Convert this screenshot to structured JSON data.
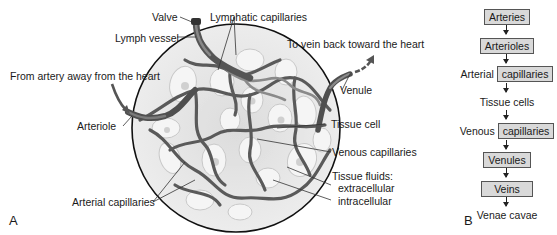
{
  "panel_a": {
    "letter": "A",
    "labels": {
      "valve": "Valve",
      "lymph_vessel": "Lymph vessel",
      "lymphatic_capillaries": "Lymphatic capillaries",
      "to_vein": "To vein back toward the heart",
      "from_artery": "From artery away from the heart",
      "venule": "Venule",
      "arteriole": "Arteriole",
      "tissue_cell": "Tissue cell",
      "venous_capillaries": "Venous capillaries",
      "tissue_fluids": "Tissue fluids:",
      "extracellular": "extracellular",
      "intracellular": "intracellular",
      "arterial_capillaries": "Arterial capillaries"
    },
    "colors": {
      "vessel": "#6e6e6e",
      "vessel_dark": "#4a4a4a",
      "circle_fill": "#e6e6e6",
      "cell_fill": "#f4f4f4",
      "outline": "#111111"
    }
  },
  "panel_b": {
    "letter": "B",
    "flow": [
      {
        "prefix": "",
        "boxed": "Arteries",
        "suffix": ""
      },
      {
        "prefix": "",
        "boxed": "Arterioles",
        "suffix": ""
      },
      {
        "prefix": "Arterial ",
        "boxed": "capillaries",
        "suffix": ""
      },
      {
        "prefix": "Tissue cells",
        "boxed": "",
        "suffix": ""
      },
      {
        "prefix": "Venous ",
        "boxed": "capillaries",
        "suffix": ""
      },
      {
        "prefix": "",
        "boxed": "Venules",
        "suffix": ""
      },
      {
        "prefix": "",
        "boxed": "Veins",
        "suffix": ""
      },
      {
        "prefix": "Venae cavae",
        "boxed": "",
        "suffix": ""
      }
    ],
    "box_fill": "#d9d9d9"
  }
}
